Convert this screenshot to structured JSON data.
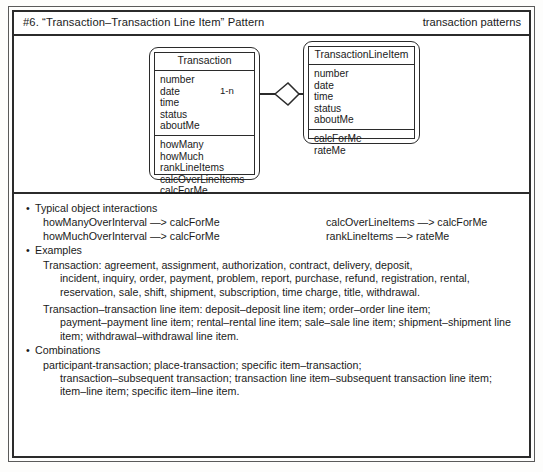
{
  "header": {
    "title": "#6. “Transaction–Transaction Line Item” Pattern",
    "category": "transaction patterns"
  },
  "diagram": {
    "classes": [
      {
        "name": "Transaction",
        "attributes": [
          "number",
          "date",
          "time",
          "status",
          "aboutMe"
        ],
        "operations": [
          "howMany",
          "howMuch",
          "rankLineItems",
          "calcOverLineItems",
          "calcForMe"
        ]
      },
      {
        "name": "TransactionLineItem",
        "attributes": [
          "number",
          "date",
          "time",
          "status",
          "aboutMe"
        ],
        "operations": [
          "calcForMe",
          "rateMe"
        ]
      }
    ],
    "association": {
      "source_multiplicity": "1-n",
      "target_multiplicity": "1",
      "marker": "aggregation-diamond"
    }
  },
  "content": {
    "interactions_heading": "Typical object interactions",
    "interactions_left": [
      "howManyOverInterval —> calcForMe",
      "howMuchOverInterval —> calcForMe"
    ],
    "interactions_right": [
      "calcOverLineItems —> calcForMe",
      "rankLineItems —> rateMe"
    ],
    "examples_heading": "Examples",
    "examples": [
      {
        "lead": "Transaction: agreement, assignment, authorization, contract, delivery, deposit,",
        "cont": "incident, inquiry, order, payment, problem, report, purchase, refund, registration, rental, reservation, sale, shift, shipment, subscription, time charge, title, withdrawal."
      },
      {
        "lead": "Transaction–transaction line item: deposit–deposit line item; order–order line item;",
        "cont": "payment–payment line item; rental–rental line item; sale–sale line item; shipment–shipment line item; withdrawal–withdrawal line item."
      }
    ],
    "combinations_heading": "Combinations",
    "combinations": {
      "lead": "participant-transaction; place-transaction; specific item–transaction;",
      "cont": "transaction–subsequent transaction; transaction line item–subsequent transaction line item; item–line item; specific item–line item."
    },
    "bullet_char": "•"
  },
  "colors": {
    "ink": "#1a1a1a",
    "rule": "#2b2b2b",
    "paper": "#ffffff"
  }
}
